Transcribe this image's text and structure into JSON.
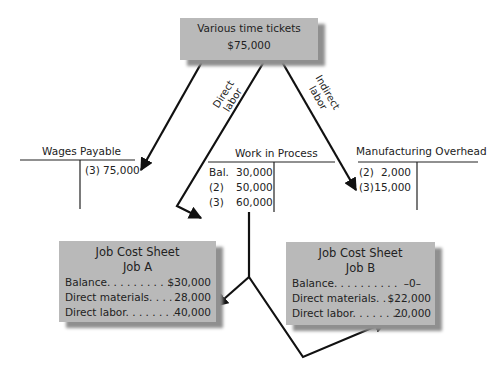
{
  "source_box": {
    "title": "Various time tickets",
    "amount": "$75,000"
  },
  "arrow_labels": {
    "direct_labor_line1": "Direct",
    "direct_labor_line2": "labor",
    "indirect_labor_line1": "Indirect",
    "indirect_labor_line2": "labor"
  },
  "t_accounts": {
    "wages_payable": {
      "title": "Wages Payable",
      "credit": [
        {
          "ref": "(3)",
          "amount": "75,000"
        }
      ]
    },
    "work_in_process": {
      "title": "Work in Process",
      "debit": [
        {
          "ref": "Bal.",
          "amount": "30,000"
        },
        {
          "ref": "(2)",
          "amount": "50,000"
        },
        {
          "ref": "(3)",
          "amount": "60,000"
        }
      ]
    },
    "manufacturing_overhead": {
      "title": "Manufacturing Overhead",
      "debit": [
        {
          "ref": "(2)",
          "amount": "2,000"
        },
        {
          "ref": "(3)",
          "amount": "15,000"
        }
      ]
    }
  },
  "job_cost_sheets": {
    "job_a": {
      "title": "Job Cost Sheet",
      "subtitle": "Job A",
      "rows": [
        {
          "label": "Balance. . . . . . . . . . .",
          "amount": "$30,000"
        },
        {
          "label": "Direct materials. . . . .",
          "amount": "28,000"
        },
        {
          "label": "Direct labor. . . . . . . .",
          "amount": "40,000"
        }
      ]
    },
    "job_b": {
      "title": "Job Cost Sheet",
      "subtitle": "Job B",
      "rows": [
        {
          "label": "Balance. . . . . . . . . .",
          "amount": "–0–"
        },
        {
          "label": "Direct materials. . . .",
          "amount": "$22,000"
        },
        {
          "label": "Direct labor. . . . . . . .",
          "amount": "20,000"
        }
      ]
    }
  },
  "colors": {
    "box_fill": "#b9b9b9",
    "box_shadow": "#8f8f8f",
    "line": "#111111"
  }
}
